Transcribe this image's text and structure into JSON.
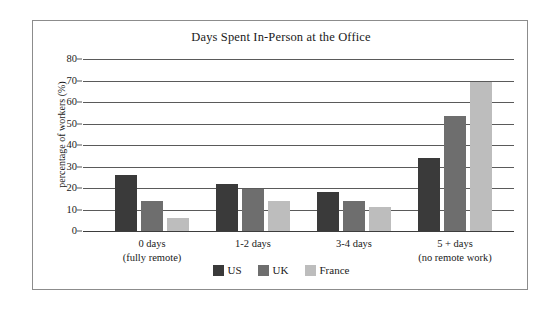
{
  "chart_data": {
    "type": "bar",
    "title": "Days Spent In-Person at the Office",
    "xlabel": "",
    "ylabel": "percentage of workers (%)",
    "ylim": [
      0,
      80
    ],
    "yticks": [
      0,
      10,
      20,
      30,
      40,
      50,
      60,
      70,
      80
    ],
    "ytick_labels": [
      "0",
      "10",
      "20",
      "30",
      "40",
      "50",
      "60",
      "70",
      "80"
    ],
    "grid": true,
    "legend_position": "bottom-center",
    "categories": [
      "0 days\n(fully remote)",
      "1-2 days",
      "3-4 days",
      "5 + days\n(no remote work)"
    ],
    "category_lines": [
      {
        "line1": "0 days",
        "line2": "(fully remote)"
      },
      {
        "line1": "1-2 days",
        "line2": ""
      },
      {
        "line1": "3-4 days",
        "line2": ""
      },
      {
        "line1": "5 + days",
        "line2": "(no remote work)"
      }
    ],
    "series": [
      {
        "name": "US",
        "color": "#3a3a3a",
        "values": [
          26,
          22,
          18,
          34
        ]
      },
      {
        "name": "UK",
        "color": "#6e6e6e",
        "values": [
          14,
          19.5,
          14,
          53.5
        ]
      },
      {
        "name": "France",
        "color": "#bdbdbd",
        "values": [
          6,
          14,
          11,
          69.5
        ]
      }
    ]
  },
  "legend": {
    "items": [
      {
        "label": "US",
        "color": "#3a3a3a"
      },
      {
        "label": "UK",
        "color": "#6e6e6e"
      },
      {
        "label": "France",
        "color": "#bdbdbd"
      }
    ]
  },
  "colors": {
    "us": "#3a3a3a",
    "uk": "#6e6e6e",
    "france": "#bdbdbd",
    "frame": "#8c8c8c",
    "gridline": "#5a5a5a",
    "text": "#1a1a1a",
    "background": "#ffffff"
  }
}
